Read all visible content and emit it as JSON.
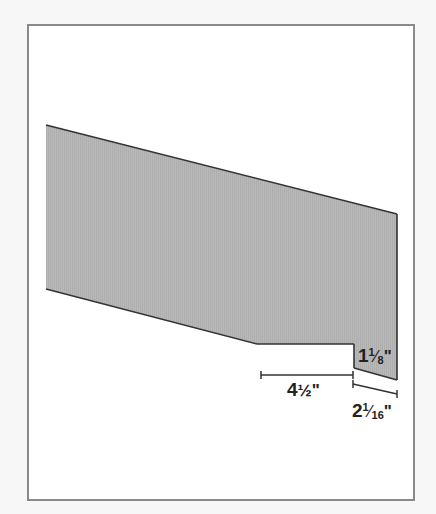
{
  "diagram": {
    "type": "dimensioned-board-profile",
    "colors": {
      "background": "#f7f7f7",
      "frame_border": "#8a8a8a",
      "frame_fill": "#ffffff",
      "shape_fill": "#b5b5b5",
      "shape_stroke": "#333333",
      "dimension_line": "#333333",
      "label_text": "#222222"
    },
    "shape": {
      "points": "46,125 397,214 397,380 354,368 354,344 257,344 46,289"
    },
    "dimensions": [
      {
        "id": "notch-width",
        "whole": "4",
        "fraction_char": "½",
        "numerator": "",
        "denominator": "",
        "inch_mark": "\"",
        "line": {
          "x1": 261,
          "y1": 375,
          "x2": 353,
          "y2": 375
        }
      },
      {
        "id": "notch-depth",
        "whole": "1",
        "numerator": "1",
        "denominator": "8",
        "inch_mark": "\""
      },
      {
        "id": "end-offset",
        "whole": "2",
        "numerator": "1",
        "denominator": "16",
        "inch_mark": "\"",
        "line": {
          "x1": 353,
          "y1": 384,
          "x2": 397,
          "y2": 394
        }
      }
    ]
  }
}
